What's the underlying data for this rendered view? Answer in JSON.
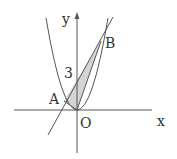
{
  "figure": {
    "axis_labels": {
      "x": "x",
      "y": "y"
    },
    "points": {
      "origin": {
        "label": "O",
        "px": [
          77,
          110
        ]
      },
      "A": {
        "label": "A",
        "px": [
          64,
          101
        ]
      },
      "B": {
        "label": "B",
        "px": [
          101,
          41
        ]
      }
    },
    "y_intercept_label": "3",
    "shaded_region": "triangle AOB",
    "colors": {
      "stroke": "#555555",
      "shade": "#d4d4d4",
      "background": "#ffffff"
    }
  }
}
